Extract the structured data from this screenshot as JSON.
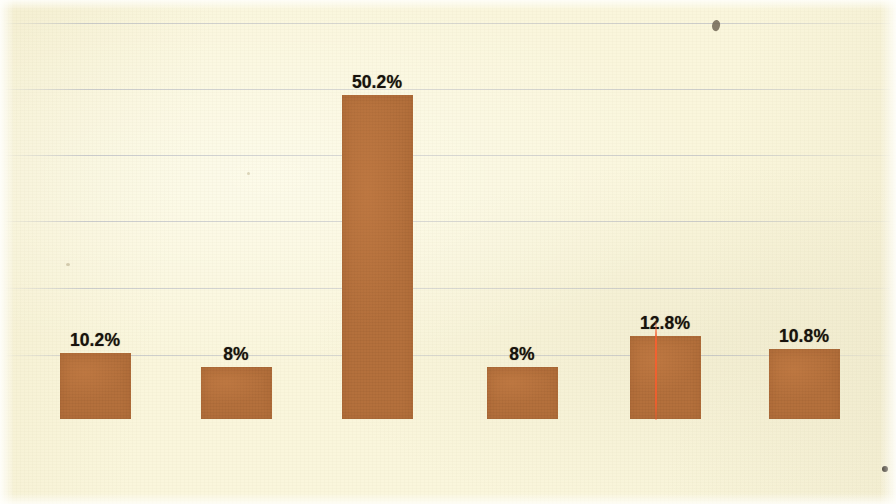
{
  "chart_data": {
    "type": "bar",
    "title": "",
    "subtitle": "",
    "xlabel": "",
    "ylabel": "",
    "grid": true,
    "legend": "none",
    "ylim": [
      0,
      60
    ],
    "gridline_positions_px": [
      23,
      89,
      155,
      221,
      288,
      355
    ],
    "categories": [
      "Lack of early warning",
      "Lack of assistance to IDPs",
      "Man made disasters",
      "Food insecurity",
      "Ineffective disaster management",
      "Lack of assistance to victims"
    ],
    "values": [
      10.2,
      8,
      50.2,
      8,
      12.8,
      10.8
    ],
    "value_labels": [
      "10.2%",
      "8%",
      "50.2%",
      "8%",
      "12.8%",
      "10.8%"
    ],
    "bar_color": "#b4703c",
    "background_color": "#faf6dc",
    "gridline_color": "#8a92b2",
    "label_color": "#1b150e"
  },
  "bars": [
    {
      "label_line1": "Lack of early",
      "label_line2": "warning",
      "label_line3": "",
      "value_label": "10.2%"
    },
    {
      "label_line1": "Lack of",
      "label_line2": "assistance to",
      "label_line3": "IDPs",
      "value_label": "8%"
    },
    {
      "label_line1": "Man made",
      "label_line2": "disasters",
      "label_line3": "",
      "value_label": "50.2%"
    },
    {
      "label_line1": "Food insecurity",
      "label_line2": "",
      "label_line3": "",
      "value_label": "8%"
    },
    {
      "label_line1": "Ineffective",
      "label_line2": "disaster",
      "label_line3": "management",
      "value_label": "12.8%"
    },
    {
      "label_line1": "Lack of",
      "label_line2": "assistance to",
      "label_line3": "victims",
      "value_label": "10.8%"
    }
  ]
}
